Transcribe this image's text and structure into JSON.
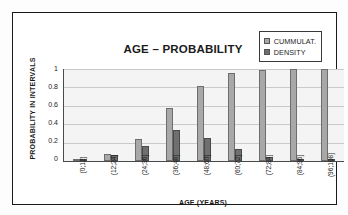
{
  "chart_data": {
    "type": "bar",
    "title": "AGE – PROBABILITY",
    "xlabel": "AGE (YEARS)",
    "ylabel": "PROBABILITY IN INTERVALS",
    "categories": [
      "(0;12]",
      "(12;24]",
      "(24;36]",
      "(36;48]",
      "(48;60]",
      "(60;72]",
      "(72;84]",
      "(84;96]",
      "(96;108]"
    ],
    "series": [
      {
        "name": "CUMMULAT.",
        "color": "#a8a8a8",
        "values": [
          0.02,
          0.08,
          0.24,
          0.58,
          0.82,
          0.955,
          0.99,
          1.0,
          1.0
        ]
      },
      {
        "name": "DENSITY",
        "color": "#6f6f6f",
        "values": [
          0.02,
          0.06,
          0.16,
          0.34,
          0.245,
          0.135,
          0.045,
          0.01,
          0.01
        ]
      }
    ],
    "ylim": [
      0,
      1
    ],
    "yticks": [
      "0",
      "0.2",
      "0.4",
      "0.6",
      "0.8",
      "1"
    ],
    "ytick_values": [
      0,
      0.2,
      0.4,
      0.6,
      0.8,
      1
    ],
    "grid": true,
    "legend_position": "top-right",
    "plot_background": "#f4f4f4"
  }
}
